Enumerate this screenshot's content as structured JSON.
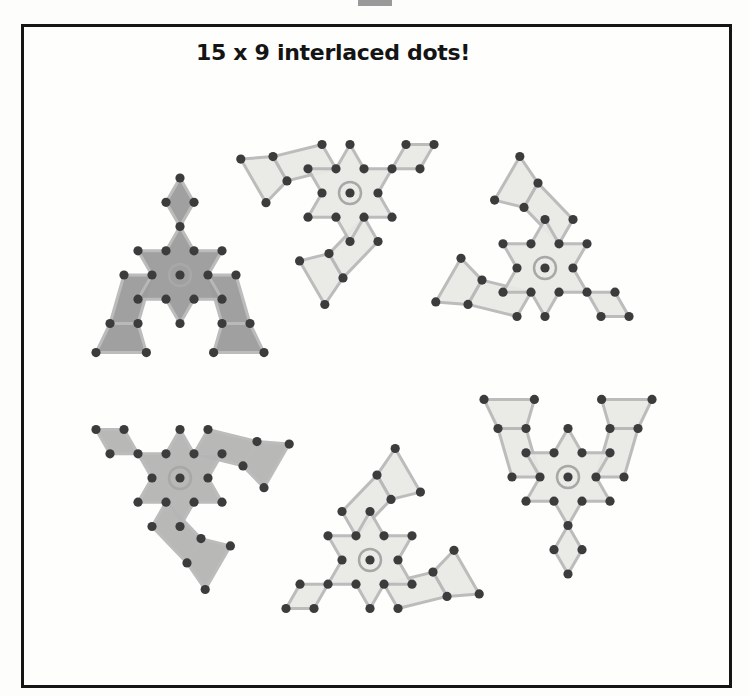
{
  "figure": {
    "title": "15 x 9 interlaced dots!",
    "colors": {
      "frame": "#151515",
      "dot": "#3c3c3c",
      "line": "#b9b9b9",
      "fill_light": "#e9e9e6",
      "fill_dark": "#9c9c9c",
      "fill_mid": "#b5b5b3"
    },
    "motifs": [
      {
        "name": "top-left-motif",
        "cx": 180,
        "cy": 275,
        "rot": 0,
        "shade": "dark"
      },
      {
        "name": "top-middle-motif",
        "cx": 350,
        "cy": 193,
        "rot": 60,
        "shade": "light"
      },
      {
        "name": "top-right-motif",
        "cx": 545,
        "cy": 268,
        "rot": 120,
        "shade": "light"
      },
      {
        "name": "bottom-left-motif",
        "cx": 180,
        "cy": 478,
        "rot": 300,
        "shade": "mid"
      },
      {
        "name": "bottom-middle-motif",
        "cx": 370,
        "cy": 560,
        "rot": 240,
        "shade": "light"
      },
      {
        "name": "bottom-right-motif",
        "cx": 568,
        "cy": 477,
        "rot": 180,
        "shade": "light"
      }
    ]
  }
}
